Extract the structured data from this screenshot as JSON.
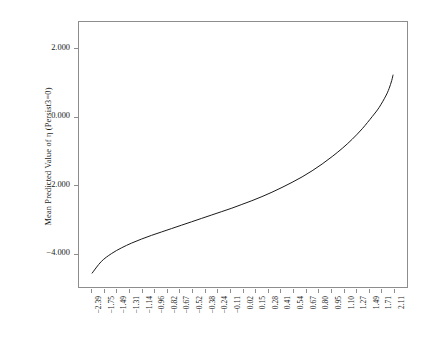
{
  "chart_data": {
    "type": "line",
    "title": "",
    "subtitle": "",
    "xlabel": "",
    "ylabel": "Mean Predicted Value of η (Persist3=0)",
    "legend": [],
    "grid": false,
    "legend_position": "none",
    "series_name": "mean-predicted-eta",
    "line_color": "#1a1a1a",
    "frame_color": "#8d8d8d",
    "background_color": "#ffffff",
    "ylim": [
      -5.0,
      2.8
    ],
    "yticks": [
      2.0,
      0.0,
      -2.0,
      -4.0
    ],
    "ytick_labels": [
      "2.000",
      "0.000",
      "-2.000",
      "-4.000"
    ],
    "xtick_labels": [
      "-2.39",
      "-1.75",
      "-1.49",
      "-1.31",
      "-1.14",
      "-0.96",
      "-0.82",
      "-0.67",
      "-0.52",
      "-0.38",
      "-0.24",
      "-0.11",
      "0.02",
      "0.15",
      "0.28",
      "0.41",
      "0.54",
      "0.67",
      "0.80",
      "0.95",
      "1.10",
      "1.27",
      "1.49",
      "1.71",
      "2.11"
    ],
    "x": [
      -2.39,
      -2.25,
      -2.1,
      -1.95,
      -1.8,
      -1.65,
      -1.5,
      -1.35,
      -1.2,
      -1.05,
      -0.9,
      -0.75,
      -0.6,
      -0.45,
      -0.3,
      -0.15,
      0.0,
      0.15,
      0.3,
      0.45,
      0.6,
      0.75,
      0.9,
      1.05,
      1.2,
      1.35,
      1.5,
      1.65,
      1.8,
      1.9,
      2.0,
      2.05,
      2.09,
      2.11
    ],
    "values": [
      -4.6,
      -4.25,
      -4.02,
      -3.85,
      -3.71,
      -3.59,
      -3.48,
      -3.38,
      -3.28,
      -3.18,
      -3.08,
      -2.98,
      -2.88,
      -2.78,
      -2.68,
      -2.57,
      -2.46,
      -2.34,
      -2.21,
      -2.07,
      -1.92,
      -1.76,
      -1.58,
      -1.38,
      -1.16,
      -0.92,
      -0.65,
      -0.34,
      0.02,
      0.28,
      0.62,
      0.84,
      1.08,
      1.25
    ]
  }
}
